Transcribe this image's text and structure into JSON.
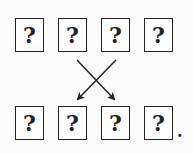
{
  "diagram": {
    "top_row": [
      {
        "label": "?"
      },
      {
        "label": "?"
      },
      {
        "label": "?"
      },
      {
        "label": "?"
      }
    ],
    "bottom_row": [
      {
        "label": "?"
      },
      {
        "label": "?"
      },
      {
        "label": "?"
      },
      {
        "label": "?"
      }
    ],
    "arrows": [
      {
        "from": "top_row.1",
        "to": "bottom_row.2"
      },
      {
        "from": "top_row.2",
        "to": "bottom_row.1"
      }
    ],
    "trailing_punctuation": "."
  }
}
